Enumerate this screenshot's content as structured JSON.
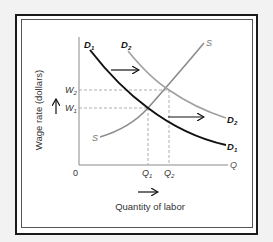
{
  "diagram": {
    "y_axis_label": "Wage rate (dollars)",
    "x_axis_label": "Quantity of labor",
    "origin_label": "0",
    "x_axis_end_label": "Q",
    "wage_labels": {
      "w1": "W",
      "w1_sub": "1",
      "w2": "W",
      "w2_sub": "2"
    },
    "quantity_labels": {
      "q1": "Q",
      "q1_sub": "1",
      "q2": "Q",
      "q2_sub": "2"
    },
    "curves": {
      "d1": {
        "label": "D",
        "sub": "1",
        "color": "#111111"
      },
      "d2": {
        "label": "D",
        "sub": "2",
        "color": "#9a9a9a"
      },
      "s": {
        "label": "S",
        "color": "#8c8c8c"
      }
    },
    "equilibria": [
      {
        "name": "initial",
        "wage": "W1",
        "quantity": "Q1"
      },
      {
        "name": "new",
        "wage": "W2",
        "quantity": "Q2"
      }
    ],
    "arrows": [
      "demand-shift-right-top",
      "demand-shift-right-bottom",
      "wage-up",
      "quantity-right"
    ]
  }
}
